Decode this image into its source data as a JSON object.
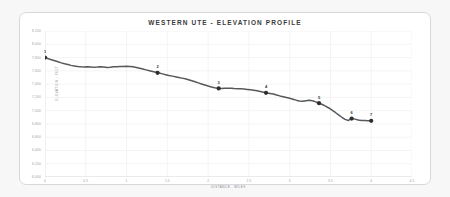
{
  "card": {
    "title": "WESTERN UTE - ELEVATION PROFILE",
    "border_color": "#d8d8da",
    "background": "#ffffff"
  },
  "chart_data": {
    "type": "line",
    "title": "WESTERN UTE - ELEVATION PROFILE",
    "xlabel": "DISTANCE - MILES",
    "ylabel": "ELEVATION - FEET",
    "grid": true,
    "legend": "none",
    "line_color": "#58585c",
    "marker_color": "#2e2e30",
    "xlim": [
      0,
      4.5
    ],
    "ylim": [
      6000,
      8200
    ],
    "xticks": [
      0,
      0.5,
      1,
      1.5,
      2,
      2.5,
      3,
      3.5,
      4,
      4.5
    ],
    "xticklabels": [
      "0",
      "0.5",
      "1",
      "1.5",
      "2",
      "2.5",
      "3",
      "3.5",
      "4",
      "4.5"
    ],
    "yticks": [
      6000,
      6200,
      6400,
      6600,
      6800,
      7000,
      7200,
      7400,
      7600,
      7800,
      8000,
      8200
    ],
    "yticklabels": [
      "6,000",
      "6,200",
      "6,400",
      "6,600",
      "6,800",
      "7,000",
      "7,200",
      "7,400",
      "7,600",
      "7,800",
      "8,000",
      "8,200"
    ],
    "x": [
      0.0,
      0.04,
      0.08,
      0.12,
      0.16,
      0.2,
      0.24,
      0.28,
      0.32,
      0.36,
      0.4,
      0.44,
      0.48,
      0.52,
      0.56,
      0.6,
      0.64,
      0.68,
      0.72,
      0.76,
      0.8,
      0.84,
      0.88,
      0.92,
      0.96,
      1.0,
      1.04,
      1.08,
      1.12,
      1.16,
      1.2,
      1.24,
      1.28,
      1.32,
      1.36,
      1.4,
      1.44,
      1.48,
      1.52,
      1.56,
      1.6,
      1.64,
      1.68,
      1.72,
      1.76,
      1.8,
      1.84,
      1.88,
      1.92,
      1.96,
      2.0,
      2.04,
      2.08,
      2.12,
      2.16,
      2.2,
      2.24,
      2.28,
      2.32,
      2.36,
      2.4,
      2.44,
      2.48,
      2.52,
      2.56,
      2.6,
      2.64,
      2.68,
      2.72,
      2.76,
      2.8,
      2.84,
      2.88,
      2.92,
      2.96,
      3.0,
      3.04,
      3.08,
      3.12,
      3.16,
      3.2,
      3.24,
      3.28,
      3.32,
      3.36,
      3.4,
      3.44,
      3.48,
      3.52,
      3.56,
      3.6,
      3.64,
      3.68,
      3.72,
      3.76,
      3.8,
      3.84,
      3.88,
      3.92,
      3.96,
      4.0
    ],
    "y": [
      7800,
      7782,
      7768,
      7752,
      7736,
      7720,
      7706,
      7694,
      7682,
      7672,
      7664,
      7660,
      7658,
      7660,
      7658,
      7652,
      7656,
      7662,
      7656,
      7650,
      7654,
      7660,
      7662,
      7664,
      7666,
      7668,
      7666,
      7660,
      7650,
      7638,
      7626,
      7614,
      7602,
      7590,
      7578,
      7566,
      7554,
      7542,
      7530,
      7520,
      7510,
      7500,
      7490,
      7480,
      7466,
      7450,
      7434,
      7418,
      7402,
      7386,
      7370,
      7356,
      7344,
      7336,
      7334,
      7336,
      7338,
      7336,
      7332,
      7330,
      7328,
      7326,
      7320,
      7314,
      7308,
      7300,
      7288,
      7276,
      7266,
      7258,
      7250,
      7236,
      7222,
      7210,
      7198,
      7186,
      7172,
      7158,
      7146,
      7140,
      7148,
      7156,
      7150,
      7132,
      7112,
      7092,
      7068,
      7040,
      7006,
      6972,
      6936,
      6900,
      6868,
      6852,
      6880,
      6872,
      6858,
      6852,
      6850,
      6848,
      6846
    ],
    "markers": [
      {
        "label": "1",
        "x": 0.0,
        "y": 7800
      },
      {
        "label": "2",
        "x": 1.38,
        "y": 7570
      },
      {
        "label": "3",
        "x": 2.13,
        "y": 7335
      },
      {
        "label": "4",
        "x": 2.71,
        "y": 7268
      },
      {
        "label": "5",
        "x": 3.36,
        "y": 7112
      },
      {
        "label": "6",
        "x": 3.76,
        "y": 6880
      },
      {
        "label": "7",
        "x": 4.0,
        "y": 6846
      }
    ]
  }
}
